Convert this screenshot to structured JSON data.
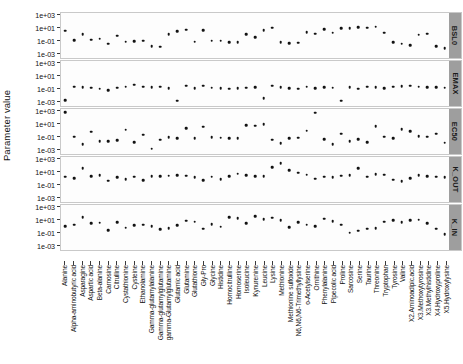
{
  "chart_data": {
    "type": "scatter",
    "title": "",
    "xlabel": "",
    "ylabel": "Parameter value",
    "yscale": "log10",
    "ylim": [
      0.001,
      1000
    ],
    "ytick_labels": [
      "1e+03",
      "1e+01",
      "1e-01",
      "1e-03"
    ],
    "ytick_values": [
      1000,
      10,
      0.1,
      0.001
    ],
    "grid": false,
    "legend_position": "none",
    "facet_position": "right",
    "facets": [
      "BSL0",
      "EMAX",
      "EC50",
      "K_OUT",
      "K_IN"
    ],
    "categories": [
      "Alanine",
      "Alpha-aminobutyric acid",
      "Asparagine",
      "Aspartic acid",
      "Beta-alanine",
      "Carnosine",
      "Citrulline",
      "Cystathionine",
      "Cysteine",
      "Ethanolamine",
      "Gamma-glutamylalanine",
      "Gamma-glutamylglutamine",
      "gamma-Glutamylglutamine",
      "Glutamic acid",
      "Glutamine",
      "Glutathione",
      "Gly-Pro",
      "Glycine",
      "Histidine",
      "Homocitrulline",
      "Homoserine",
      "Isoleucine",
      "Kynurenine",
      "Leucine",
      "Lysine",
      "Methionine",
      "Methionine sulfoxide",
      "N6,N6,N6-Trimethyllysine",
      "o-Acetylserine",
      "Ornithine",
      "Phenylalanine",
      "Pipecolic acid",
      "Proline",
      "Sarcosine",
      "Serine",
      "Taurine",
      "Threonine",
      "Tryptophan",
      "Tyrosine",
      "Valine",
      "X2.Aminoadipic.acid",
      "X3.Methoxytyrosine",
      "X3.Methylhistidine",
      "X4.Hydroxyproline",
      "X5.Hydroxylysine"
    ],
    "series": [
      {
        "name": "BSL0",
        "values": [
          4.0,
          0.12,
          1.1,
          0.15,
          0.2,
          0.03,
          0.6,
          0.07,
          0.08,
          0.09,
          0.012,
          0.011,
          1.0,
          3.0,
          6.0,
          0.07,
          4.5,
          0.1,
          0.09,
          0.06,
          0.05,
          1.2,
          0.35,
          5.0,
          12.0,
          0.06,
          0.035,
          0.045,
          2.2,
          1.4,
          6.5,
          1.8,
          9.0,
          11.0,
          13.0,
          12.5,
          18.0,
          2.0,
          0.06,
          0.03,
          0.02,
          0.9,
          1.3,
          0.012,
          0.006
        ]
      },
      {
        "name": "EMAX",
        "values": [
          0.0015,
          0.2,
          0.16,
          0.14,
          0.1,
          0.06,
          0.14,
          0.19,
          0.45,
          0.2,
          0.18,
          0.2,
          0.13,
          0.0012,
          0.28,
          0.12,
          0.3,
          0.15,
          0.12,
          0.1,
          0.13,
          0.14,
          0.16,
          0.003,
          0.3,
          0.17,
          0.12,
          0.1,
          0.2,
          0.12,
          0.17,
          0.15,
          0.0012,
          0.18,
          0.1,
          0.2,
          0.16,
          0.13,
          0.2,
          0.25,
          0.3,
          0.2,
          0.18,
          0.16,
          0.15
        ]
      },
      {
        "name": "EC50",
        "values": [
          900.0,
          0.1,
          0.006,
          0.6,
          0.02,
          0.02,
          0.025,
          1.4,
          0.014,
          0.2,
          0.0012,
          0.03,
          0.08,
          0.06,
          2.2,
          0.05,
          4.0,
          0.08,
          0.07,
          0.05,
          0.06,
          7.0,
          6.0,
          9.0,
          0.03,
          0.008,
          0.05,
          0.07,
          0.9,
          700.0,
          0.04,
          0.006,
          0.3,
          0.02,
          0.04,
          0.012,
          5.0,
          0.1,
          0.06,
          1.5,
          0.7,
          0.12,
          0.1,
          0.3,
          0.01
        ]
      },
      {
        "name": "K_OUT",
        "values": [
          2.0,
          1.2,
          40.0,
          2.5,
          3.0,
          0.4,
          1.5,
          0.8,
          2.0,
          0.5,
          2.5,
          2.2,
          2.8,
          3.0,
          2.6,
          1.5,
          0.5,
          2.0,
          0.8,
          2.5,
          6.0,
          3.0,
          2.5,
          2.2,
          60.0,
          300.0,
          20.0,
          8.0,
          4.0,
          0.9,
          2.0,
          1.6,
          2.8,
          3.5,
          40.0,
          2.0,
          5.0,
          4.0,
          0.6,
          0.35,
          1.0,
          3.0,
          2.5,
          1.8,
          1.5
        ]
      },
      {
        "name": "K_IN",
        "values": [
          1.0,
          2.0,
          30.0,
          3.0,
          4.0,
          0.25,
          5.0,
          0.6,
          1.5,
          2.0,
          1.2,
          0.35,
          0.5,
          1.5,
          8.0,
          6.0,
          0.4,
          2.5,
          0.9,
          30.0,
          20.0,
          3.0,
          40.0,
          15.0,
          25.0,
          10.0,
          0.8,
          5.0,
          2.0,
          1.2,
          18.0,
          7.0,
          2.0,
          0.1,
          0.2,
          0.4,
          0.5,
          6.0,
          10.0,
          5.0,
          9.0,
          12.0,
          3.0,
          0.4,
          0.05
        ]
      }
    ]
  }
}
